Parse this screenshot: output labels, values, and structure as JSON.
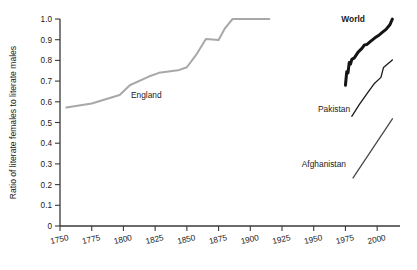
{
  "chart_data": {
    "type": "line",
    "title": "",
    "xlabel": "",
    "ylabel": "Ratio of literate females to literate males",
    "xlim": [
      1750,
      2018
    ],
    "ylim": [
      0,
      1.0
    ],
    "grid": false,
    "legend_position": "inline-annotations",
    "xticks": [
      "1750",
      "1775",
      "1800",
      "1825",
      "1850",
      "1875",
      "1900",
      "1925",
      "1950",
      "1975",
      "2000"
    ],
    "xtick_values": [
      1750,
      1775,
      1800,
      1825,
      1850,
      1875,
      1900,
      1925,
      1950,
      1975,
      2000
    ],
    "yticks": [
      "0",
      "0.1",
      "0.2",
      "0.3",
      "0.4",
      "0.5",
      "0.6",
      "0.7",
      "0.8",
      "0.9",
      "1.0"
    ],
    "ytick_values": [
      0,
      0.1,
      0.2,
      0.3,
      0.4,
      0.5,
      0.6,
      0.7,
      0.8,
      0.9,
      1.0
    ],
    "series": [
      {
        "name": "England",
        "label": "England",
        "color": "#a8a8a8",
        "width": 2.0,
        "bold_label": false,
        "label_x": 1818,
        "label_y": 0.635,
        "points": [
          [
            1755,
            0.572
          ],
          [
            1775,
            0.592
          ],
          [
            1797,
            0.633
          ],
          [
            1805,
            0.68
          ],
          [
            1820,
            0.722
          ],
          [
            1828,
            0.74
          ],
          [
            1843,
            0.752
          ],
          [
            1850,
            0.767
          ],
          [
            1858,
            0.833
          ],
          [
            1865,
            0.903
          ],
          [
            1875,
            0.899
          ],
          [
            1880,
            0.955
          ],
          [
            1886,
            1.0
          ],
          [
            1915,
            1.0
          ]
        ]
      },
      {
        "name": "World",
        "label": "World",
        "color": "#141414",
        "width": 3.0,
        "bold_label": true,
        "label_x": 1981,
        "label_y": 1.0,
        "points": [
          [
            1975,
            0.68
          ],
          [
            1976,
            0.745
          ],
          [
            1977,
            0.74
          ],
          [
            1978,
            0.79
          ],
          [
            1979,
            0.782
          ],
          [
            1980,
            0.805
          ],
          [
            1982,
            0.812
          ],
          [
            1985,
            0.84
          ],
          [
            1988,
            0.858
          ],
          [
            1990,
            0.875
          ],
          [
            1992,
            0.877
          ],
          [
            1995,
            0.893
          ],
          [
            1998,
            0.908
          ],
          [
            2001,
            0.92
          ],
          [
            2004,
            0.935
          ],
          [
            2007,
            0.95
          ],
          [
            2010,
            0.972
          ],
          [
            2012,
            1.0
          ]
        ]
      },
      {
        "name": "Pakistan",
        "label": "Pakistan",
        "color": "#1a1a1a",
        "width": 1.3,
        "bold_label": false,
        "label_x": 1966,
        "label_y": 0.565,
        "points": [
          [
            1980,
            0.53
          ],
          [
            1986,
            0.588
          ],
          [
            1992,
            0.64
          ],
          [
            1998,
            0.69
          ],
          [
            2003,
            0.718
          ],
          [
            2005,
            0.766
          ],
          [
            2008,
            0.781
          ],
          [
            2012,
            0.802
          ]
        ]
      },
      {
        "name": "Afghanistan",
        "label": "Afghanistan",
        "color": "#4a4a4a",
        "width": 1.3,
        "bold_label": false,
        "label_x": 1958,
        "label_y": 0.3,
        "points": [
          [
            1981,
            0.232
          ],
          [
            2012,
            0.518
          ]
        ]
      }
    ]
  }
}
